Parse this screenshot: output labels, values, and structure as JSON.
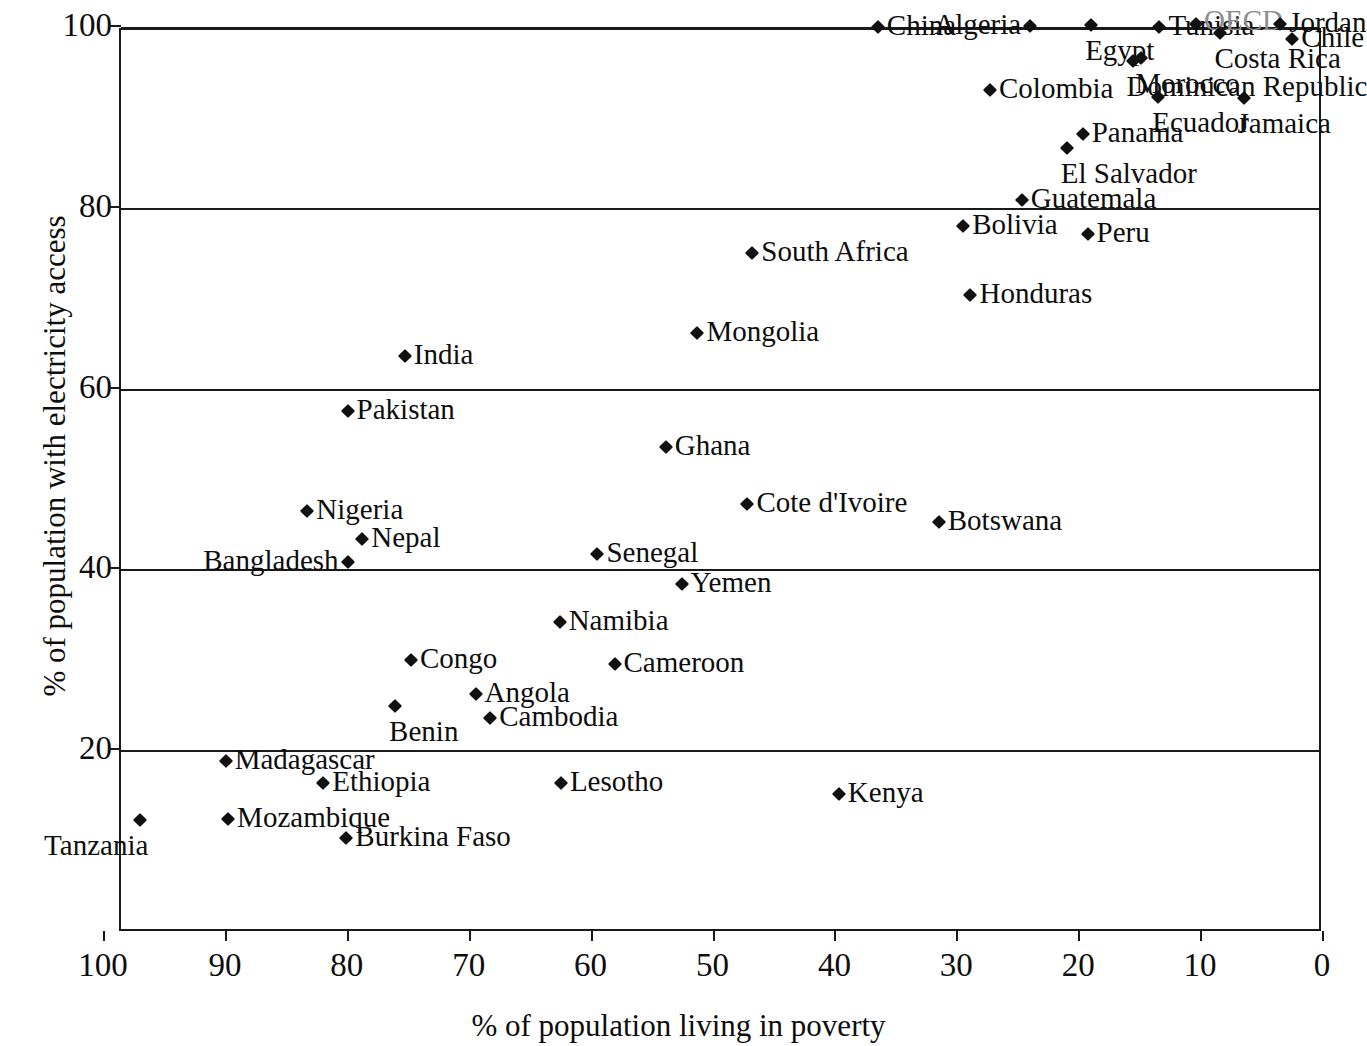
{
  "chart_data": {
    "type": "scatter",
    "title": "",
    "xlabel": "% of population living in poverty",
    "ylabel": "% of population with electricity access",
    "xlim": [
      100,
      0
    ],
    "xlim_note": "x axis is reversed: 100 at left, 0 at right",
    "ylim": [
      0,
      100
    ],
    "xticks": [
      100,
      90,
      80,
      70,
      60,
      50,
      40,
      30,
      20,
      10,
      0
    ],
    "yticks": [
      20,
      40,
      60,
      80,
      100
    ],
    "grid": "horizontal gridlines at 20, 40, 60, 80, 100",
    "legend": "none",
    "marker": "black diamond",
    "points": [
      {
        "label": "China",
        "x": 36.6,
        "y": 100.0,
        "side": "right"
      },
      {
        "label": "Algeria",
        "x": 24.1,
        "y": 100.1,
        "side": "left"
      },
      {
        "label": "Egypt",
        "x": 19.1,
        "y": 100.2,
        "side": "below"
      },
      {
        "label": "Tunisia",
        "x": 13.5,
        "y": 100.0,
        "side": "right"
      },
      {
        "label": "OECD",
        "x": 10.5,
        "y": 100.3,
        "side": "oecd"
      },
      {
        "label": "Jordan",
        "x": 3.6,
        "y": 100.3,
        "side": "right"
      },
      {
        "label": "Costa Rica",
        "x": 8.5,
        "y": 99.3,
        "side": "below"
      },
      {
        "label": "Chile",
        "x": 2.6,
        "y": 98.7,
        "side": "right"
      },
      {
        "label": "Morocco",
        "x": 15.0,
        "y": 96.6,
        "side": "below"
      },
      {
        "label": "Colombia",
        "x": 27.4,
        "y": 93.0,
        "side": "right"
      },
      {
        "label": "Dominican Republic",
        "x": 15.7,
        "y": 96.2,
        "side": "below"
      },
      {
        "label": "Ecuador",
        "x": 13.6,
        "y": 92.2,
        "side": "below"
      },
      {
        "label": "Jamaica",
        "x": 6.6,
        "y": 92.1,
        "side": "below"
      },
      {
        "label": "Panama",
        "x": 19.8,
        "y": 88.2,
        "side": "right"
      },
      {
        "label": "El Salvador",
        "x": 21.1,
        "y": 86.6,
        "side": "below"
      },
      {
        "label": "Guatemala",
        "x": 24.8,
        "y": 80.9,
        "side": "right"
      },
      {
        "label": "Bolivia",
        "x": 29.6,
        "y": 78.0,
        "side": "right"
      },
      {
        "label": "Peru",
        "x": 19.4,
        "y": 77.1,
        "side": "right"
      },
      {
        "label": "South Africa",
        "x": 46.9,
        "y": 75.0,
        "side": "right"
      },
      {
        "label": "Honduras",
        "x": 29.0,
        "y": 70.4,
        "side": "right"
      },
      {
        "label": "Mongolia",
        "x": 51.4,
        "y": 66.1,
        "side": "right"
      },
      {
        "label": "India",
        "x": 75.4,
        "y": 63.6,
        "side": "right"
      },
      {
        "label": "Pakistan",
        "x": 80.1,
        "y": 57.5,
        "side": "right"
      },
      {
        "label": "Ghana",
        "x": 54.0,
        "y": 53.5,
        "side": "right"
      },
      {
        "label": "Cote d'Ivoire",
        "x": 47.3,
        "y": 47.2,
        "side": "right"
      },
      {
        "label": "Nigeria",
        "x": 83.4,
        "y": 46.5,
        "side": "right"
      },
      {
        "label": "Botswana",
        "x": 31.6,
        "y": 45.2,
        "side": "right"
      },
      {
        "label": "Nepal",
        "x": 78.9,
        "y": 43.4,
        "side": "right"
      },
      {
        "label": "Senegal",
        "x": 59.6,
        "y": 41.7,
        "side": "right"
      },
      {
        "label": "Bangladesh",
        "x": 80.1,
        "y": 40.8,
        "side": "left"
      },
      {
        "label": "Yemen",
        "x": 52.7,
        "y": 38.4,
        "side": "right"
      },
      {
        "label": "Namibia",
        "x": 62.7,
        "y": 34.2,
        "side": "right"
      },
      {
        "label": "Congo",
        "x": 74.9,
        "y": 30.0,
        "side": "right"
      },
      {
        "label": "Cameroon",
        "x": 58.2,
        "y": 29.5,
        "side": "right"
      },
      {
        "label": "Angola",
        "x": 69.6,
        "y": 26.2,
        "side": "right"
      },
      {
        "label": "Benin",
        "x": 76.2,
        "y": 24.9,
        "side": "below"
      },
      {
        "label": "Cambodia",
        "x": 68.4,
        "y": 23.5,
        "side": "right"
      },
      {
        "label": "Madagascar",
        "x": 90.1,
        "y": 18.8,
        "side": "right"
      },
      {
        "label": "Ethiopia",
        "x": 82.1,
        "y": 16.3,
        "side": "right"
      },
      {
        "label": "Lesotho",
        "x": 62.6,
        "y": 16.4,
        "side": "right"
      },
      {
        "label": "Kenya",
        "x": 39.8,
        "y": 15.1,
        "side": "right"
      },
      {
        "label": "Mozambique",
        "x": 89.9,
        "y": 12.4,
        "side": "right"
      },
      {
        "label": "Tanzania",
        "x": 97.1,
        "y": 12.3,
        "side": "below-left"
      },
      {
        "label": "Burkina Faso",
        "x": 80.2,
        "y": 10.3,
        "side": "right"
      }
    ]
  },
  "axes": {
    "x_title": "% of population living in poverty",
    "y_title": "% of population with electricity access",
    "x_tick_labels": [
      "100",
      "90",
      "80",
      "70",
      "60",
      "50",
      "40",
      "30",
      "20",
      "10",
      "0"
    ],
    "y_tick_labels": [
      "100",
      "80",
      "60",
      "40",
      "20"
    ]
  },
  "colors": {
    "marker": "#111111",
    "axis": "#1a1a1a",
    "text": "#0d0d0d",
    "oecd_label": "#8e8e8e",
    "background": "#ffffff"
  }
}
